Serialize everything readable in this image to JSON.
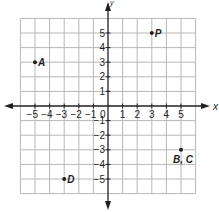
{
  "chart_data": {
    "type": "scatter",
    "title": "",
    "xlabel": "x",
    "ylabel": "y",
    "xlim": [
      -6,
      6
    ],
    "ylim": [
      -6,
      6
    ],
    "grid": true,
    "x_ticks": [
      -5,
      -4,
      -3,
      -2,
      -1,
      0,
      1,
      2,
      3,
      4,
      5
    ],
    "y_ticks": [
      -5,
      -4,
      -3,
      -2,
      -1,
      1,
      2,
      3,
      4,
      5
    ],
    "origin_label": "0",
    "points": [
      {
        "label": "A",
        "x": -5,
        "y": 3
      },
      {
        "label": "P",
        "x": 3,
        "y": 5
      },
      {
        "label": "B, C",
        "x": 5,
        "y": -3
      },
      {
        "label": "D",
        "x": -3,
        "y": -5
      }
    ]
  },
  "colors": {
    "grid": "#b8b8b8",
    "axis": "#231f20",
    "point": "#231f20",
    "text": "#231f20"
  }
}
